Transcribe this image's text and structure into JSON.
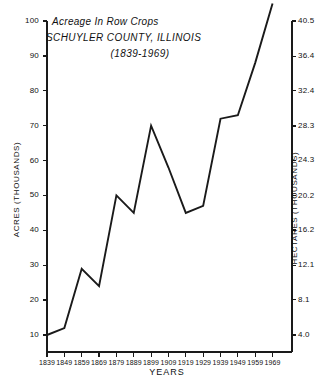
{
  "chart_data": {
    "type": "line",
    "title": "Acreage In Row Crops",
    "subtitle": "SCHUYLER COUNTY, ILLINOIS",
    "subtitle2": "(1839-1969)",
    "xlabel": "YEARS",
    "ylabel": "ACRES (THOUSANDS)",
    "y2label": "HECTARES (THOUSANDS)",
    "x": [
      1839,
      1849,
      1859,
      1869,
      1879,
      1889,
      1899,
      1909,
      1919,
      1929,
      1939,
      1949,
      1959,
      1969
    ],
    "values": [
      10,
      12,
      29,
      24,
      50,
      45,
      70,
      58,
      45,
      47,
      72,
      73,
      88,
      105
    ],
    "categories": [
      "1839",
      "1849",
      "1859",
      "1869",
      "1879",
      "1889",
      "1899",
      "1909",
      "1919",
      "1929",
      "1939",
      "1949",
      "1959",
      "1969"
    ],
    "ylim": [
      10,
      100
    ],
    "yticks": [
      10,
      20,
      30,
      40,
      50,
      60,
      70,
      80,
      90,
      100
    ],
    "ytick_labels": [
      "10",
      "20",
      "30",
      "40",
      "50",
      "60",
      "70",
      "80",
      "90",
      "100"
    ],
    "y2lim": [
      4.0,
      40.5
    ],
    "y2ticks": [
      4.0,
      8.1,
      12.1,
      16.2,
      20.2,
      24.3,
      28.3,
      32.4,
      36.4,
      40.5
    ],
    "y2tick_labels": [
      "4.0",
      "8.1",
      "12.1",
      "16.2",
      "20.2",
      "24.3",
      "28.3",
      "32.4",
      "36.4",
      "40.5"
    ],
    "grid": false,
    "legend": "none",
    "line_color": "#1a1a1a",
    "axis_color": "#1a1a1a",
    "background": "#ffffff"
  }
}
